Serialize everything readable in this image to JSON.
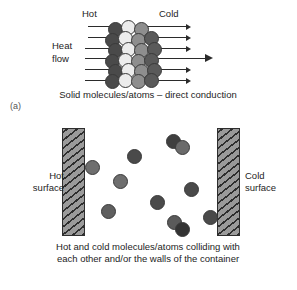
{
  "figure": {
    "panel_a": {
      "label": "(a)",
      "labels": {
        "hot": "Hot",
        "cold": "Cold",
        "heat": "Heat",
        "flow": "flow"
      },
      "caption": "Solid molecules/atoms – direct conduction",
      "arrow_count": 6,
      "arrow_direction": "left-to-right",
      "lattice": {
        "description": "close-packed hexagonal lattice of solid atoms",
        "columns": 4,
        "column_shades": [
          "#4a4a4a",
          "#ececec",
          "#8e8e8e",
          "#5a5a5a"
        ],
        "atoms": [
          {
            "x": 108,
            "y": 22,
            "shade": "#4a4a4a"
          },
          {
            "x": 121,
            "y": 20,
            "shade": "#ececec"
          },
          {
            "x": 134,
            "y": 22,
            "shade": "#8e8e8e"
          },
          {
            "x": 105,
            "y": 33,
            "shade": "#4a4a4a"
          },
          {
            "x": 118,
            "y": 31,
            "shade": "#ececec"
          },
          {
            "x": 131,
            "y": 33,
            "shade": "#8e8e8e"
          },
          {
            "x": 144,
            "y": 31,
            "shade": "#5a5a5a"
          },
          {
            "x": 108,
            "y": 43,
            "shade": "#4a4a4a"
          },
          {
            "x": 121,
            "y": 42,
            "shade": "#ececec"
          },
          {
            "x": 134,
            "y": 43,
            "shade": "#8e8e8e"
          },
          {
            "x": 147,
            "y": 42,
            "shade": "#5a5a5a"
          },
          {
            "x": 105,
            "y": 54,
            "shade": "#4a4a4a"
          },
          {
            "x": 118,
            "y": 53,
            "shade": "#ececec"
          },
          {
            "x": 131,
            "y": 54,
            "shade": "#8e8e8e"
          },
          {
            "x": 144,
            "y": 53,
            "shade": "#5a5a5a"
          },
          {
            "x": 108,
            "y": 64,
            "shade": "#4a4a4a"
          },
          {
            "x": 121,
            "y": 63,
            "shade": "#ececec"
          },
          {
            "x": 134,
            "y": 64,
            "shade": "#8e8e8e"
          },
          {
            "x": 147,
            "y": 63,
            "shade": "#5a5a5a"
          },
          {
            "x": 105,
            "y": 74,
            "shade": "#4a4a4a"
          },
          {
            "x": 118,
            "y": 73,
            "shade": "#ececec"
          },
          {
            "x": 131,
            "y": 74,
            "shade": "#8e8e8e"
          },
          {
            "x": 144,
            "y": 73,
            "shade": "#5a5a5a"
          }
        ]
      },
      "arrows": [
        {
          "y": 26,
          "x_in": 88,
          "x_out": 160,
          "x_tip": 186,
          "long": false
        },
        {
          "y": 37,
          "x_in": 88,
          "x_out": 160,
          "x_tip": 186,
          "long": false
        },
        {
          "y": 48,
          "x_in": 85,
          "x_out": 160,
          "x_tip": 186,
          "long": false
        },
        {
          "y": 58,
          "x_in": 85,
          "x_out": 160,
          "x_tip": 205,
          "long": true
        },
        {
          "y": 69,
          "x_in": 85,
          "x_out": 160,
          "x_tip": 186,
          "long": false
        },
        {
          "y": 80,
          "x_in": 85,
          "x_out": 160,
          "x_tip": 186,
          "long": false
        }
      ]
    },
    "panel_b": {
      "label": "(b)",
      "labels": {
        "hot_surface_line1": "Hot",
        "hot_surface_line2": "surface",
        "cold_surface_line1": "Cold",
        "cold_surface_line2": "surface"
      },
      "caption_line1": "Hot and cold molecules/atoms colliding with",
      "caption_line2": "each other and/or the walls of the container",
      "walls": {
        "hot": {
          "x": 62,
          "y": 16,
          "width": 23,
          "height": 108,
          "hatched": true
        },
        "cold": {
          "x": 217,
          "y": 16,
          "width": 23,
          "height": 108,
          "hatched": true
        }
      },
      "molecules": [
        {
          "x": 85,
          "y": 48,
          "shade": "#6e6e6e"
        },
        {
          "x": 127,
          "y": 37,
          "shade": "#4a4a4a"
        },
        {
          "x": 113,
          "y": 62,
          "shade": "#6e6e6e"
        },
        {
          "x": 101,
          "y": 92,
          "shade": "#5f5f5f"
        },
        {
          "x": 150,
          "y": 83,
          "shade": "#4a4a4a"
        },
        {
          "x": 166,
          "y": 22,
          "shade": "#3f3f3f"
        },
        {
          "x": 175,
          "y": 28,
          "shade": "#6a6a6a"
        },
        {
          "x": 184,
          "y": 70,
          "shade": "#4a4a4a"
        },
        {
          "x": 167,
          "y": 103,
          "shade": "#5a5a5a"
        },
        {
          "x": 175,
          "y": 110,
          "shade": "#333333"
        },
        {
          "x": 203,
          "y": 98,
          "shade": "#4a4a4a"
        }
      ]
    }
  }
}
